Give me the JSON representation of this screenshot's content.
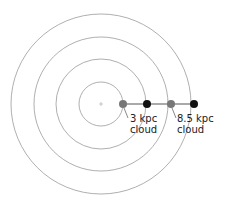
{
  "diagram": {
    "center": {
      "x": 101,
      "y": 104
    },
    "rings": [
      {
        "name": "ring-1",
        "r": 22
      },
      {
        "name": "ring-2",
        "r": 45
      },
      {
        "name": "ring-3",
        "r": 67
      },
      {
        "name": "ring-4",
        "r": 90
      }
    ],
    "points": [
      {
        "name": "cloud-3kpc-dot",
        "x": 123,
        "color": "#777777"
      },
      {
        "name": "dot-2",
        "x": 147,
        "color": "#111111"
      },
      {
        "name": "cloud-8-5kpc-dot",
        "x": 171,
        "color": "#777777"
      },
      {
        "name": "dot-4",
        "x": 194,
        "color": "#111111"
      }
    ],
    "labels": {
      "cloud_3kpc_line1": "3 kpc",
      "cloud_3kpc_line2": "cloud",
      "cloud_8_5kpc_line1": "8.5 kpc",
      "cloud_8_5kpc_line2": "cloud"
    },
    "colors": {
      "ring": "#9a9a9a",
      "connector": "#555555",
      "center_marker": "#bbbbbb"
    }
  }
}
